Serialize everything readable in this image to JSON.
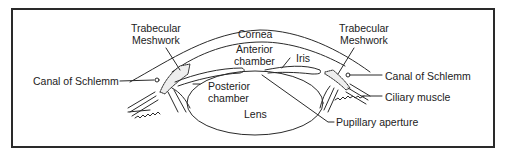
{
  "figure": {
    "colors": {
      "line": "#2a2a2a",
      "background": "#ffffff"
    }
  },
  "labels": {
    "trabecular_left_1": "Trabecular",
    "trabecular_left_2": "Meshwork",
    "trabecular_right_1": "Trabecular",
    "trabecular_right_2": "Meshwork",
    "cornea": "Cornea",
    "anterior_1": "Anterior",
    "anterior_2": "chamber",
    "iris": "Iris",
    "canal_left": "Canal of Schlemm",
    "canal_right": "Canal of Schlemm",
    "posterior_1": "Posterior",
    "posterior_2": "chamber",
    "lens": "Lens",
    "ciliary": "Ciliary muscle",
    "pupillary": "Pupillary aperture"
  }
}
